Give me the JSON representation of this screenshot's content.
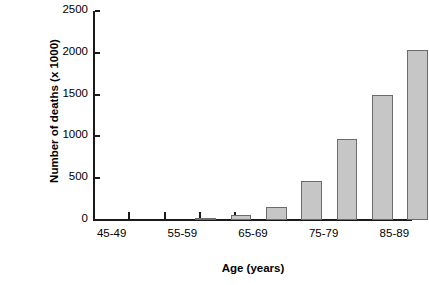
{
  "chart_data": {
    "type": "bar",
    "title": "",
    "xlabel": "Age (years)",
    "ylabel": "Number of deaths (x 1000)",
    "categories": [
      "45-49",
      "50-54",
      "55-59",
      "60-64",
      "65-69",
      "70-74",
      "75-79",
      "80-84",
      "85-89"
    ],
    "tick_labels_shown": [
      "45-49",
      "55-59",
      "65-69",
      "75-79",
      "85-89"
    ],
    "values": [
      10,
      55,
      160,
      470,
      970,
      1500,
      2035,
      1990,
      1170
    ],
    "ylim": [
      0,
      2500
    ],
    "yticks": [
      0,
      500,
      1000,
      1500,
      2000,
      2500
    ],
    "ytick_labels": [
      "0",
      "500",
      "1000",
      "1500",
      "2000",
      "2500"
    ],
    "grid": false,
    "legend": "none",
    "bar_fill_color": "#c6c6c6",
    "bar_edge_color": "#6b6b6b",
    "axis_color": "#1a1a1a",
    "background_color": "#ffffff"
  }
}
